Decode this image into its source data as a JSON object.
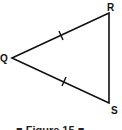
{
  "figure": {
    "type": "isosceles-triangle",
    "vertices": {
      "Q": {
        "label": "Q",
        "x": 12,
        "y": 58
      },
      "R": {
        "label": "R",
        "x": 109,
        "y": 13
      },
      "S": {
        "label": "S",
        "x": 109,
        "y": 103
      }
    },
    "congruent_sides": [
      "QR",
      "QS"
    ],
    "tick_marks": 2,
    "stroke_color": "#111111",
    "caption": "■ Figure 15 ■"
  }
}
